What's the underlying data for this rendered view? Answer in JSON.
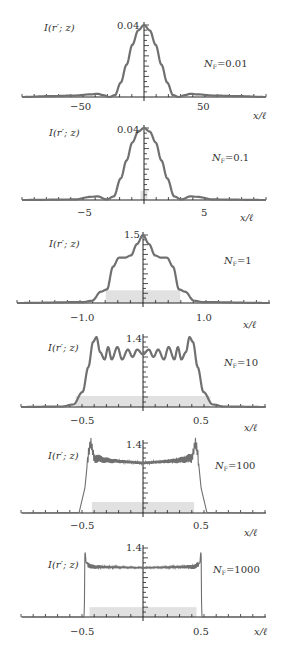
{
  "figure": {
    "ylabel": "I(r′; z)",
    "xlabel": "x/ℓ"
  },
  "panels": [
    {
      "nf_label": "N",
      "nf_sub": "F",
      "nf_value": "=0.01",
      "ymax_label": "0.04",
      "xticks_labels": [
        "−50",
        "50"
      ]
    },
    {
      "nf_label": "N",
      "nf_sub": "F",
      "nf_value": "=0.1",
      "ymax_label": "0.04",
      "xticks_labels": [
        "−5",
        "5"
      ]
    },
    {
      "nf_label": "N",
      "nf_sub": "F",
      "nf_value": "=1",
      "ymax_label": "1.5",
      "xticks_labels": [
        "−1.0",
        "1.0"
      ]
    },
    {
      "nf_label": "N",
      "nf_sub": "F",
      "nf_value": "=10",
      "ymax_label": "1.4",
      "xticks_labels": [
        "−0.5",
        "0.5"
      ]
    },
    {
      "nf_label": "N",
      "nf_sub": "F",
      "nf_value": "=100",
      "ymax_label": "1.4",
      "xticks_labels": [
        "−0.5",
        "0.5"
      ]
    },
    {
      "nf_label": "N",
      "nf_sub": "F",
      "nf_value": "=1000",
      "ymax_label": "1.4",
      "xticks_labels": [
        "−0.5",
        "0.5"
      ]
    }
  ],
  "colors": {
    "curve": "#707070",
    "axis": "#222222",
    "fill": "#c8c8c8"
  },
  "chart_data": [
    {
      "type": "line",
      "title": "N_F = 0.01",
      "xlabel": "x/ℓ",
      "ylabel": "I(r'; z)",
      "xlim": [
        -105,
        105
      ],
      "ylim": [
        0,
        0.04
      ],
      "xticks": [
        -50,
        50
      ],
      "yticks_labeled": [
        0.04
      ],
      "x": [
        -105,
        -80,
        -60,
        -45,
        -40,
        -35,
        -30,
        -25,
        -20,
        -15,
        -10,
        -5,
        0,
        5,
        10,
        15,
        20,
        25,
        30,
        35,
        40,
        45,
        60,
        80,
        105
      ],
      "y": [
        0,
        0.0005,
        0.0008,
        0.0015,
        0.0018,
        0.001,
        0,
        0.001,
        0.008,
        0.018,
        0.029,
        0.037,
        0.04,
        0.037,
        0.029,
        0.018,
        0.008,
        0.001,
        0,
        0.001,
        0.0018,
        0.0015,
        0.0008,
        0.0005,
        0
      ]
    },
    {
      "type": "line",
      "title": "N_F = 0.1",
      "xlabel": "x/ℓ",
      "ylabel": "I(r'; z)",
      "xlim": [
        -10.5,
        10.5
      ],
      "ylim": [
        0,
        0.04
      ],
      "xticks": [
        -5,
        5
      ],
      "yticks_labeled": [
        0.04
      ],
      "x": [
        -10.5,
        -6,
        -4.5,
        -4,
        -3.2,
        -2.6,
        -2,
        -1.5,
        -1,
        -0.5,
        0,
        0.5,
        1,
        1.5,
        2,
        2.6,
        3.2,
        4,
        4.5,
        6,
        10.5
      ],
      "y": [
        0,
        0.0003,
        0.0018,
        0.002,
        0.0003,
        0.002,
        0.012,
        0.022,
        0.032,
        0.038,
        0.04,
        0.038,
        0.032,
        0.022,
        0.012,
        0.002,
        0.0003,
        0.002,
        0.0018,
        0.0003,
        0
      ]
    },
    {
      "type": "line",
      "title": "N_F = 1",
      "xlabel": "x/ℓ",
      "ylabel": "I(r'; z)",
      "xlim": [
        -2.1,
        2.1
      ],
      "ylim": [
        0,
        1.5
      ],
      "xticks": [
        -1.0,
        1.0
      ],
      "yticks_labeled": [
        1.5
      ],
      "x": [
        -2.1,
        -1.0,
        -0.85,
        -0.7,
        -0.6,
        -0.5,
        -0.4,
        -0.3,
        -0.2,
        -0.1,
        0,
        0.1,
        0.2,
        0.3,
        0.4,
        0.5,
        0.6,
        0.7,
        0.85,
        1.0,
        2.1
      ],
      "y": [
        0,
        0.02,
        0.05,
        0.25,
        0.3,
        0.8,
        1.0,
        1.0,
        1.05,
        1.3,
        1.5,
        1.3,
        1.05,
        1.0,
        1.0,
        0.8,
        0.3,
        0.25,
        0.05,
        0.02,
        0
      ]
    },
    {
      "type": "line",
      "title": "N_F = 10",
      "xlabel": "x/ℓ",
      "ylabel": "I(r'; z)",
      "xlim": [
        -1.05,
        1.05
      ],
      "ylim": [
        0,
        1.4
      ],
      "xticks": [
        -0.5,
        0.5
      ],
      "yticks_labeled": [
        1.4
      ],
      "x": [
        -1.05,
        -0.7,
        -0.6,
        -0.52,
        -0.47,
        -0.43,
        -0.4,
        -0.37,
        -0.33,
        -0.3,
        -0.27,
        -0.22,
        -0.18,
        -0.13,
        -0.09,
        -0.05,
        0,
        0.05,
        0.09,
        0.13,
        0.18,
        0.22,
        0.27,
        0.3,
        0.33,
        0.37,
        0.4,
        0.43,
        0.47,
        0.52,
        0.6,
        0.7,
        1.05
      ],
      "y": [
        0,
        0.01,
        0.05,
        0.3,
        0.8,
        1.3,
        1.4,
        1.1,
        0.95,
        1.2,
        0.95,
        1.2,
        0.95,
        1.15,
        1.0,
        1.15,
        1.05,
        1.15,
        1.0,
        1.15,
        0.95,
        1.2,
        0.95,
        1.2,
        0.95,
        1.1,
        1.4,
        1.3,
        0.8,
        0.3,
        0.05,
        0.01,
        0
      ]
    },
    {
      "type": "line",
      "title": "N_F = 100",
      "xlabel": "x/ℓ",
      "ylabel": "I(r'; z)",
      "xlim": [
        -1.05,
        1.05
      ],
      "ylim": [
        0,
        1.4
      ],
      "xticks": [
        -0.5,
        0.5
      ],
      "yticks_labeled": [
        1.4
      ],
      "x": [
        -1.05,
        -0.55,
        -0.5,
        -0.47,
        -0.45,
        -0.42,
        -0.3,
        0,
        0.3,
        0.42,
        0.45,
        0.47,
        0.5,
        0.55,
        1.05
      ],
      "y": [
        0,
        0.01,
        0.5,
        1.2,
        1.4,
        1.1,
        1.05,
        1.0,
        1.05,
        1.1,
        1.4,
        1.2,
        0.5,
        0.01,
        0
      ]
    },
    {
      "type": "line",
      "title": "N_F = 1000",
      "xlabel": "x/ℓ",
      "ylabel": "I(r'; z)",
      "xlim": [
        -1.05,
        1.05
      ],
      "ylim": [
        0,
        1.4
      ],
      "xticks": [
        -0.5,
        0.5
      ],
      "yticks_labeled": [
        1.4
      ],
      "x": [
        -1.05,
        -0.505,
        -0.5,
        -0.49,
        -0.45,
        0,
        0.45,
        0.49,
        0.5,
        0.505,
        1.05
      ],
      "y": [
        0,
        0,
        1.4,
        1.1,
        1.02,
        1.0,
        1.02,
        1.1,
        1.4,
        0,
        0
      ]
    }
  ]
}
